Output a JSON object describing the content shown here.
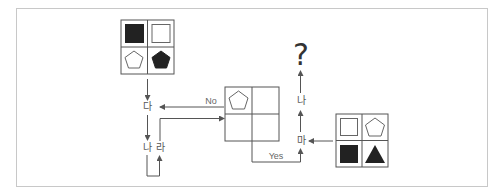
{
  "diagram": {
    "type": "flowchart-puzzle",
    "question_mark": "?",
    "colors": {
      "line": "#555555",
      "fill_dark": "#222222",
      "frame_border": "#c8c8c8",
      "background": "#ffffff"
    },
    "grids": {
      "top": {
        "cells": [
          "filled-square",
          "outline-square",
          "outline-pentagon",
          "filled-pentagon"
        ]
      },
      "center": {
        "cells": [
          "outline-pentagon",
          "empty",
          "empty",
          "empty"
        ]
      },
      "right": {
        "cells": [
          "outline-square",
          "outline-pentagon",
          "filled-square",
          "filled-triangle"
        ]
      }
    },
    "nodes": {
      "da": "다",
      "na_left": "나",
      "ra": "라",
      "ma": "마",
      "na_right": "나"
    },
    "edges": {
      "no_label": "No",
      "yes_label": "Yes"
    }
  }
}
